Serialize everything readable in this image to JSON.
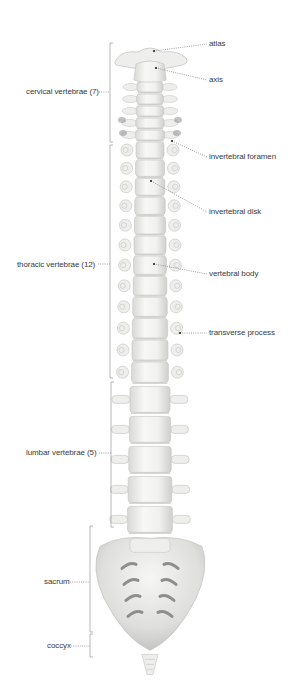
{
  "regions": [
    {
      "id": "cervical",
      "label": "cervical vertebrae (7)",
      "count": 7
    },
    {
      "id": "thoracic",
      "label": "thoracic vertebrae (12)",
      "count": 12
    },
    {
      "id": "lumbar",
      "label": "lumbar vertebrae (5)",
      "count": 5
    },
    {
      "id": "sacrum",
      "label": "sacrum"
    },
    {
      "id": "coccyx",
      "label": "coccyx"
    }
  ],
  "callouts": [
    {
      "id": "atlas",
      "label": "atlas"
    },
    {
      "id": "axis",
      "label": "axis"
    },
    {
      "id": "intervertebral-foramen",
      "label": "invertebral foramen"
    },
    {
      "id": "intervertebral-disk",
      "label": "invertebral disk"
    },
    {
      "id": "vertebral-body",
      "label": "vertebral body"
    },
    {
      "id": "transverse-process",
      "label": "transverse process"
    }
  ],
  "colors": {
    "bone": "#eeeeec",
    "bone_shade": "#c8c8c6",
    "bone_dark": "#8e8e8c",
    "leader": "#777777",
    "text": "#3a3a3a"
  }
}
